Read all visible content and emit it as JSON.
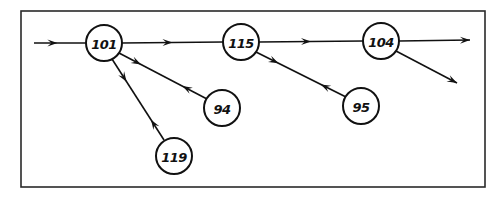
{
  "diagram": {
    "type": "flow-network",
    "frame": {
      "x": 21,
      "y": 11,
      "width": 464,
      "height": 176,
      "stroke": "#2a2a2a"
    },
    "colors": {
      "line": "#111111",
      "node_fill": "#ffffff",
      "background": "#ffffff"
    },
    "node_radius": 18,
    "nodes": [
      {
        "id": "n101",
        "label": "101",
        "x": 104,
        "y": 43
      },
      {
        "id": "n115",
        "label": "115",
        "x": 241,
        "y": 42
      },
      {
        "id": "n104",
        "label": "104",
        "x": 381,
        "y": 41
      },
      {
        "id": "n94",
        "label": "94",
        "x": 222,
        "y": 108
      },
      {
        "id": "n95",
        "label": "95",
        "x": 361,
        "y": 106
      },
      {
        "id": "n119",
        "label": "119",
        "x": 174,
        "y": 156
      }
    ],
    "edges": [
      {
        "id": "in-101",
        "from": "input",
        "to": "101",
        "x1": 34,
        "y1": 43,
        "x2": 86,
        "y2": 43,
        "arrows": [
          {
            "t": 0.45,
            "dir": "forward"
          }
        ]
      },
      {
        "id": "101-115",
        "from": "101",
        "to": "115",
        "x1": 122,
        "y1": 43,
        "x2": 223,
        "y2": 42,
        "arrows": [
          {
            "t": 0.5,
            "dir": "forward"
          }
        ]
      },
      {
        "id": "115-104",
        "from": "115",
        "to": "104",
        "x1": 259,
        "y1": 42,
        "x2": 363,
        "y2": 41,
        "arrows": [
          {
            "t": 0.5,
            "dir": "forward"
          }
        ]
      },
      {
        "id": "104-out",
        "from": "104",
        "to": "output",
        "x1": 399,
        "y1": 41,
        "x2": 470,
        "y2": 40,
        "arrows": [
          {
            "t": 1.0,
            "dir": "forward"
          }
        ]
      },
      {
        "id": "104-out2",
        "from": "104",
        "to": "output",
        "x1": 396,
        "y1": 51,
        "x2": 457,
        "y2": 83,
        "arrows": [
          {
            "t": 1.0,
            "dir": "forward"
          }
        ]
      },
      {
        "id": "101-94",
        "from": "101",
        "to": "94",
        "x1": 119,
        "y1": 53,
        "x2": 207,
        "y2": 99,
        "arrows": [
          {
            "t": 0.25,
            "dir": "forward"
          },
          {
            "t": 0.72,
            "dir": "backward"
          }
        ]
      },
      {
        "id": "101-119",
        "from": "101",
        "to": "119",
        "x1": 112,
        "y1": 59,
        "x2": 164,
        "y2": 140,
        "arrows": [
          {
            "t": 0.28,
            "dir": "forward"
          },
          {
            "t": 0.75,
            "dir": "backward"
          }
        ]
      },
      {
        "id": "115-95",
        "from": "115",
        "to": "95",
        "x1": 256,
        "y1": 52,
        "x2": 346,
        "y2": 97,
        "arrows": [
          {
            "t": 0.25,
            "dir": "forward"
          },
          {
            "t": 0.72,
            "dir": "backward"
          }
        ]
      }
    ]
  }
}
